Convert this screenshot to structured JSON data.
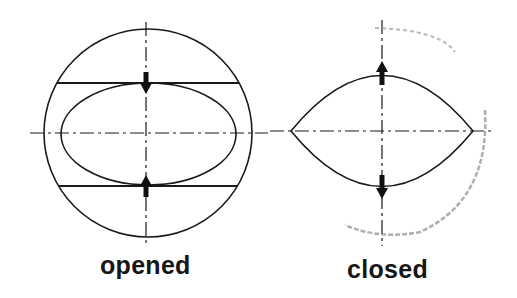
{
  "diagram": {
    "panels": [
      {
        "id": "opened",
        "label": "opened",
        "shapes": [
          "outer-circle",
          "inner-ellipse",
          "upper-chord",
          "lower-chord",
          "vertical-centerline",
          "horizontal-centerline"
        ],
        "arrows": [
          {
            "position": "top",
            "direction": "down"
          },
          {
            "position": "bottom",
            "direction": "up"
          }
        ]
      },
      {
        "id": "closed",
        "label": "closed",
        "shapes": [
          "lens-shape",
          "vertical-centerline",
          "horizontal-centerline",
          "faint-arc-trace"
        ],
        "arrows": [
          {
            "position": "top",
            "direction": "up"
          },
          {
            "position": "bottom",
            "direction": "down"
          }
        ]
      }
    ],
    "colors": {
      "stroke": "#1a1a1a",
      "arrow": "#111111",
      "faint": "#8a8a8a",
      "background": "#ffffff"
    }
  }
}
